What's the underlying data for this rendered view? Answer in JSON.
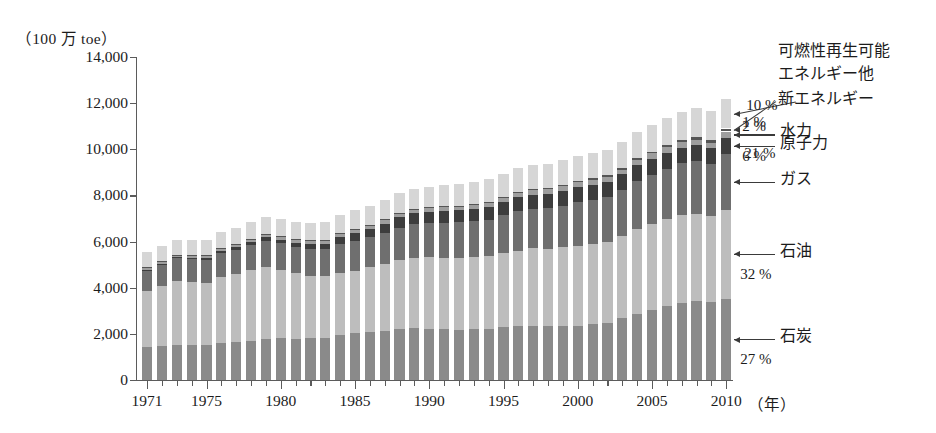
{
  "chart_data": {
    "type": "bar",
    "stacked": true,
    "title": "",
    "subtitle": "",
    "unit_label": "（100 万 toe）",
    "xlabel": "（年）",
    "ylabel": "",
    "ylim": [
      0,
      14000
    ],
    "ytick_values": [
      0,
      2000,
      4000,
      6000,
      8000,
      10000,
      12000,
      14000
    ],
    "ytick_labels": [
      "0",
      "2,000",
      "4,000",
      "6,000",
      "8,000",
      "10,000",
      "12,000",
      "14,000"
    ],
    "grid": false,
    "legend_position": "right-annotations",
    "x": [
      1971,
      1972,
      1973,
      1974,
      1975,
      1976,
      1977,
      1978,
      1979,
      1980,
      1981,
      1982,
      1983,
      1984,
      1985,
      1986,
      1987,
      1988,
      1989,
      1990,
      1991,
      1992,
      1993,
      1994,
      1995,
      1996,
      1997,
      1998,
      1999,
      2000,
      2001,
      2002,
      2003,
      2004,
      2005,
      2006,
      2007,
      2008,
      2009,
      2010
    ],
    "xtick_labels": [
      "1971",
      "1975",
      "1980",
      "1985",
      "1990",
      "1995",
      "2000",
      "2005",
      "2010"
    ],
    "xtick_values": [
      1971,
      1975,
      1980,
      1985,
      1990,
      1995,
      2000,
      2005,
      2010
    ],
    "series": [
      {
        "name": "石炭",
        "key": "coal",
        "color": "#8a8a8a",
        "final_share_pct": "27 %",
        "values": [
          1440,
          1470,
          1520,
          1510,
          1530,
          1610,
          1660,
          1700,
          1790,
          1800,
          1790,
          1800,
          1830,
          1930,
          2030,
          2060,
          2120,
          2200,
          2240,
          2230,
          2210,
          2180,
          2210,
          2220,
          2290,
          2330,
          2360,
          2330,
          2320,
          2350,
          2410,
          2470,
          2680,
          2870,
          3030,
          3210,
          3350,
          3420,
          3400,
          3530
        ]
      },
      {
        "name": "石油",
        "key": "oil",
        "color": "#bdbdbd",
        "final_share_pct": "32 %",
        "values": [
          2430,
          2600,
          2780,
          2740,
          2690,
          2870,
          2940,
          3050,
          3100,
          2970,
          2830,
          2730,
          2680,
          2720,
          2710,
          2830,
          2890,
          2990,
          3040,
          3090,
          3080,
          3110,
          3110,
          3150,
          3210,
          3270,
          3350,
          3370,
          3430,
          3480,
          3490,
          3500,
          3560,
          3690,
          3740,
          3770,
          3800,
          3790,
          3720,
          3860
        ]
      },
      {
        "name": "ガス",
        "key": "gas",
        "color": "#6f6f6f",
        "final_share_pct": "21 %",
        "values": [
          890,
          930,
          970,
          980,
          980,
          1030,
          1050,
          1090,
          1140,
          1150,
          1150,
          1160,
          1160,
          1250,
          1280,
          1290,
          1360,
          1420,
          1470,
          1490,
          1530,
          1540,
          1570,
          1580,
          1640,
          1720,
          1720,
          1760,
          1810,
          1880,
          1900,
          1950,
          2010,
          2070,
          2130,
          2180,
          2250,
          2280,
          2230,
          2400
        ]
      },
      {
        "name": "原子力",
        "key": "nuclear",
        "color": "#3d3d3d",
        "final_share_pct": "6 %",
        "values": [
          29,
          37,
          46,
          58,
          83,
          100,
          120,
          140,
          150,
          160,
          190,
          210,
          240,
          300,
          350,
          380,
          410,
          450,
          470,
          480,
          510,
          520,
          540,
          560,
          580,
          600,
          610,
          620,
          650,
          660,
          670,
          680,
          660,
          680,
          690,
          690,
          670,
          680,
          690,
          720
        ]
      },
      {
        "name": "水力",
        "key": "hydro",
        "color": "#9e9e9e",
        "final_share_pct": "2 %",
        "values": [
          100,
          103,
          106,
          112,
          117,
          119,
          122,
          128,
          132,
          134,
          137,
          140,
          148,
          152,
          157,
          160,
          163,
          169,
          170,
          176,
          180,
          182,
          190,
          192,
          200,
          205,
          206,
          208,
          212,
          215,
          213,
          216,
          213,
          224,
          229,
          233,
          241,
          248,
          252,
          262
        ]
      },
      {
        "name": "新エネルギー",
        "key": "new-energy",
        "color": "#555555",
        "final_share_pct": "1 %",
        "values": [
          4,
          4,
          4,
          5,
          5,
          5,
          6,
          6,
          7,
          7,
          8,
          9,
          10,
          11,
          13,
          14,
          15,
          17,
          19,
          21,
          23,
          25,
          27,
          29,
          32,
          35,
          38,
          41,
          45,
          50,
          54,
          60,
          66,
          74,
          83,
          93,
          104,
          113,
          120,
          130
        ]
      },
      {
        "name": "可燃性再生可能エネルギー他",
        "key": "biofuels-waste-other",
        "color": "#d6d6d6",
        "final_share_pct": "10 %",
        "values": [
          640,
          650,
          660,
          670,
          680,
          690,
          700,
          720,
          730,
          740,
          750,
          770,
          790,
          800,
          820,
          830,
          850,
          870,
          880,
          900,
          910,
          930,
          950,
          970,
          990,
          1010,
          1020,
          1040,
          1060,
          1080,
          1090,
          1100,
          1120,
          1150,
          1170,
          1190,
          1210,
          1240,
          1250,
          1290
        ]
      }
    ],
    "annotations": [
      {
        "id": "ann-biofuel",
        "pct": "10 %",
        "label_line1": "可燃性再生可能",
        "label_line2": "エネルギー他"
      },
      {
        "id": "ann-new-energy",
        "pct": "1 %",
        "label_line1": "新エネルギー",
        "label_line2": ""
      },
      {
        "id": "ann-hydro",
        "pct": "2 %",
        "label_line1": "水力",
        "label_line2": ""
      },
      {
        "id": "ann-nuclear",
        "pct": "6 %",
        "label_line1": "原子力",
        "label_line2": ""
      },
      {
        "id": "ann-gas",
        "pct": "21 %",
        "label_line1": "ガス",
        "label_line2": ""
      },
      {
        "id": "ann-oil",
        "pct": "32 %",
        "label_line1": "石油",
        "label_line2": ""
      },
      {
        "id": "ann-coal",
        "pct": "27 %",
        "label_line1": "石炭",
        "label_line2": ""
      }
    ]
  },
  "axis": {
    "unit_caption": "（100 万 toe）",
    "x_unit_caption": "（年）"
  }
}
